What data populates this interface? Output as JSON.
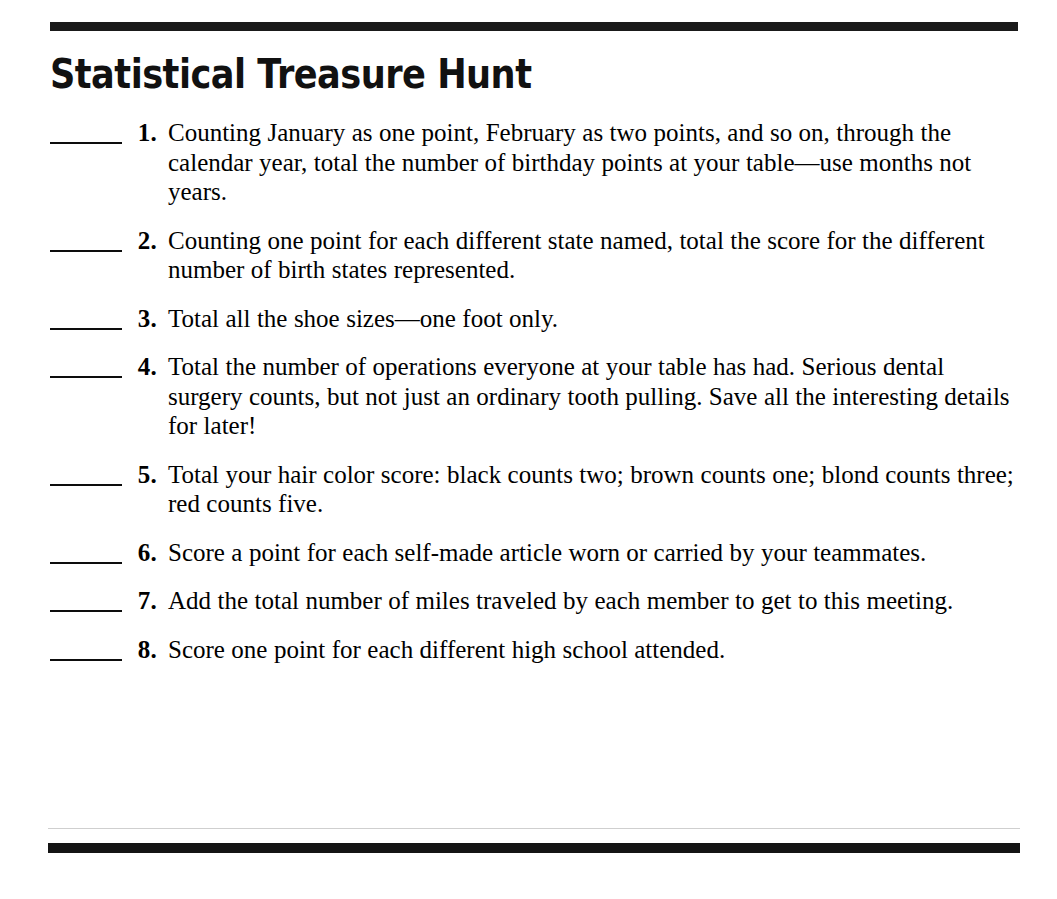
{
  "document": {
    "title": "Statistical Treasure Hunt",
    "colors": {
      "ink": "#000000",
      "rule": "#141414",
      "hairline": "#cfcfcf",
      "background": "#ffffff"
    },
    "rules": {
      "top_rule": "top-horizontal-rule",
      "hairline_rule": "faint-separator-rule",
      "bottom_rule": "bottom-horizontal-rule"
    },
    "items": [
      {
        "number": "1.",
        "blank": "answer-blank",
        "text": "Counting January as one point, February as two points, and so on, through the calendar year, total the number of birthday points at your table—use months not years."
      },
      {
        "number": "2.",
        "blank": "answer-blank",
        "text": "Counting one point for each different state named, total the score for the different number of birth states represented."
      },
      {
        "number": "3.",
        "blank": "answer-blank",
        "text": "Total all the shoe sizes—one foot only."
      },
      {
        "number": "4.",
        "blank": "answer-blank",
        "text": "Total the number of operations everyone at your table has had. Serious dental surgery counts, but not just an ordinary tooth pulling. Save all the interesting details for later!"
      },
      {
        "number": "5.",
        "blank": "answer-blank",
        "text": "Total your hair color score: black counts two; brown counts one; blond counts three; red counts five."
      },
      {
        "number": "6.",
        "blank": "answer-blank",
        "text": "Score a point for each self-made article worn or carried by your teammates."
      },
      {
        "number": "7.",
        "blank": "answer-blank",
        "text": "Add the total number of miles traveled by each member to get to this meeting."
      },
      {
        "number": "8.",
        "blank": "answer-blank",
        "text": "Score one point for each different high school attended."
      }
    ]
  }
}
